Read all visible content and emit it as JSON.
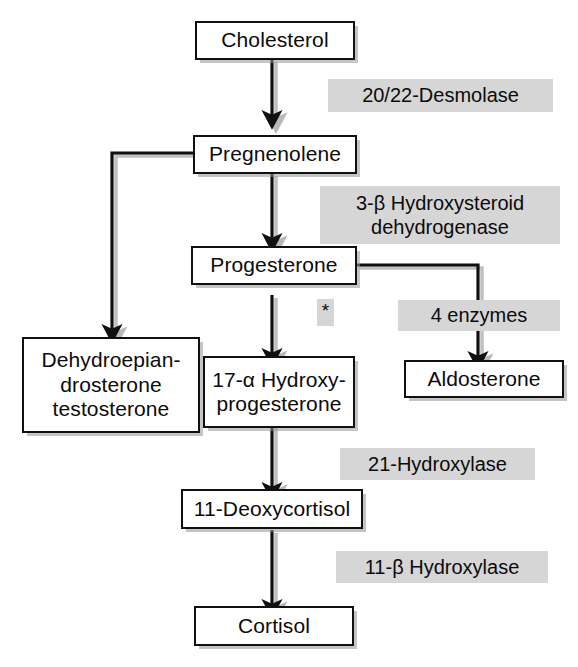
{
  "diagram": {
    "nodes": [
      {
        "id": "cholesterol",
        "label": "Cholesterol"
      },
      {
        "id": "pregnenolene",
        "label": "Pregnenolene"
      },
      {
        "id": "progesterone",
        "label": "Progesterone"
      },
      {
        "id": "dhea",
        "label": "Dehydroepian-\ndrosterone\ntestosterone"
      },
      {
        "id": "hydroxyprogesterone",
        "label": "17-α Hydroxy-\nprogesterone"
      },
      {
        "id": "aldosterone",
        "label": "Aldosterone"
      },
      {
        "id": "deoxycortisol",
        "label": "11-Deoxycortisol"
      },
      {
        "id": "cortisol",
        "label": "Cortisol"
      }
    ],
    "enzymes": [
      {
        "id": "desmolase",
        "label": "20/22-Desmolase"
      },
      {
        "id": "hsd",
        "label": "3-β Hydroxysteroid\ndehydrogenase"
      },
      {
        "id": "four-enzymes",
        "label": "4 enzymes"
      },
      {
        "id": "hydroxylase21",
        "label": "21-Hydroxylase"
      },
      {
        "id": "hydroxylase11b",
        "label": "11-β Hydroxylase"
      }
    ],
    "annotations": [
      {
        "id": "asterisk",
        "label": "*"
      }
    ],
    "colors": {
      "stroke": "#101010",
      "box_fill": "#ffffff",
      "enzyme_fill": "#d6d6d6",
      "text": "#0b0b0b",
      "background": "#ffffff"
    }
  }
}
